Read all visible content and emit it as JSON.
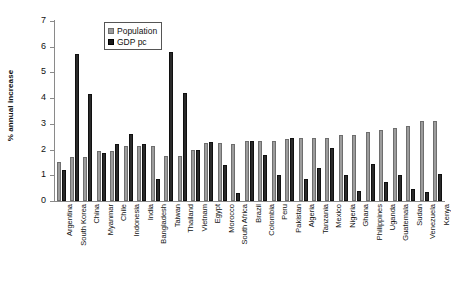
{
  "chart_data": {
    "type": "bar",
    "title": "",
    "xlabel": "",
    "ylabel": "% annual increase",
    "ylim": [
      0,
      7
    ],
    "yticks": [
      0,
      1,
      2,
      3,
      4,
      5,
      6,
      7
    ],
    "grid": false,
    "legend_position": "top-left-inside",
    "categories": [
      "Argentina",
      "South Korea",
      "China",
      "Myanmar",
      "Chile",
      "Indonesia",
      "India",
      "Bangladesh",
      "Taiwan",
      "Thailand",
      "Vietnam",
      "Egypt",
      "Morocco",
      "South Africa",
      "Brazil",
      "Colombia",
      "Peru",
      "Pakistan",
      "Algeria",
      "Tanzania",
      "Mexico",
      "Nigeria",
      "Ghana",
      "Philippines",
      "Uganda",
      "Guatemala",
      "Sudan",
      "Venezuela",
      "Kenya"
    ],
    "series": [
      {
        "name": "Population",
        "color": "#9c9c9c",
        "values": [
          1.5,
          1.7,
          1.7,
          1.95,
          1.95,
          2.15,
          2.15,
          2.15,
          1.75,
          1.75,
          2.0,
          2.25,
          2.25,
          2.2,
          2.35,
          2.35,
          2.35,
          2.4,
          2.45,
          2.45,
          2.45,
          2.55,
          2.55,
          2.7,
          2.75,
          2.85,
          2.9,
          3.1,
          3.1
        ]
      },
      {
        "name": "GDP pc",
        "color": "#1a1a1a",
        "values": [
          1.2,
          5.72,
          4.15,
          1.85,
          2.2,
          2.6,
          2.2,
          0.85,
          5.8,
          4.2,
          2.0,
          2.3,
          1.4,
          0.3,
          2.35,
          1.8,
          1.0,
          2.45,
          0.85,
          1.3,
          2.05,
          1.0,
          0.4,
          1.45,
          0.75,
          1.0,
          0.45,
          0.35,
          1.05
        ]
      }
    ]
  },
  "legend": {
    "items": [
      {
        "label": "Population"
      },
      {
        "label": "GDP pc"
      }
    ]
  }
}
